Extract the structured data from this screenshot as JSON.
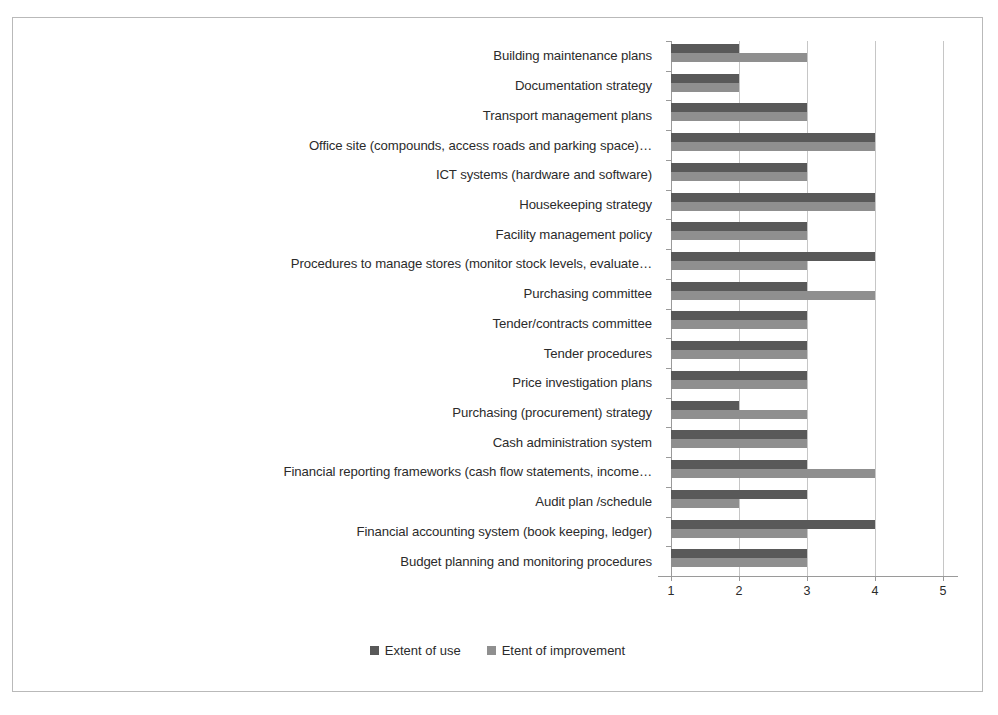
{
  "chart_data": {
    "type": "bar",
    "orientation": "horizontal",
    "title": "",
    "xlabel": "",
    "ylabel": "",
    "xlim": [
      1,
      5
    ],
    "xticks": [
      "1",
      "2",
      "3",
      "4",
      "5"
    ],
    "grid": true,
    "legend_position": "bottom",
    "categories": [
      "Building maintenance plans",
      "Documentation strategy",
      "Transport management plans",
      "Office site (compounds, access roads and parking space)…",
      "ICT systems (hardware and software)",
      "Housekeeping strategy",
      "Facility management policy",
      "Procedures to manage stores (monitor stock levels, evaluate…",
      "Purchasing committee",
      "Tender/contracts committee",
      "Tender procedures",
      "Price investigation plans",
      "Purchasing (procurement) strategy",
      "Cash administration system",
      "Financial reporting frameworks (cash flow statements, income…",
      "Audit plan /schedule",
      "Financial accounting system (book keeping, ledger)",
      "Budget planning and monitoring procedures"
    ],
    "series": [
      {
        "name": "Extent of use",
        "color": "#595959",
        "values": [
          2,
          2,
          3,
          4,
          3,
          4,
          3,
          4,
          3,
          3,
          3,
          3,
          2,
          3,
          3,
          3,
          4,
          3
        ]
      },
      {
        "name": "Etent of improvement",
        "color": "#8f8f8f",
        "values": [
          3,
          2,
          3,
          4,
          3,
          4,
          3,
          3,
          4,
          3,
          3,
          3,
          3,
          3,
          4,
          2,
          3,
          3
        ]
      }
    ]
  }
}
